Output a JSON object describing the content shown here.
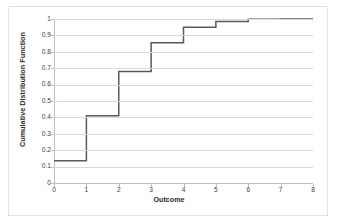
{
  "chart_data": {
    "type": "line",
    "subtype": "step-post",
    "title": "",
    "xlabel": "Outcome",
    "ylabel": "Cumulative Distribution Function",
    "xlim": [
      0,
      8
    ],
    "ylim": [
      0,
      1
    ],
    "xticks": [
      "0",
      "1",
      "2",
      "3",
      "4",
      "5",
      "6",
      "7",
      "8"
    ],
    "xtick_values": [
      0,
      1,
      2,
      3,
      4,
      5,
      6,
      7,
      8
    ],
    "yticks": [
      "0",
      "0.1",
      "0.2",
      "0.3",
      "0.4",
      "0.5",
      "0.6",
      "0.7",
      "0.8",
      "0.9",
      "1"
    ],
    "ytick_values": [
      0,
      0.1,
      0.2,
      0.3,
      0.4,
      0.5,
      0.6,
      0.7,
      0.8,
      0.9,
      1
    ],
    "grid": "horizontal",
    "legend": "none",
    "series": [
      {
        "name": "Cumulative Distribution Function",
        "color": "#595959",
        "line_width": 1.5,
        "x": [
          0,
          1,
          2,
          3,
          4,
          5,
          6,
          7,
          8
        ],
        "values": [
          0.135,
          0.41,
          0.68,
          0.855,
          0.95,
          0.985,
          0.998,
          1.0,
          1.0
        ]
      }
    ]
  },
  "axes": {
    "y_title": "Cumulative Distribution Function",
    "x_title": "Outcome"
  },
  "colors": {
    "line": "#595959",
    "gridline": "#d9d9d9",
    "axis": "#bfbfbf",
    "border": "#e3e3e3",
    "text": "#404040",
    "title_text": "#2b2b2b",
    "background": "#ffffff"
  }
}
